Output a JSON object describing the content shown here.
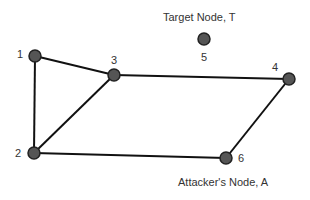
{
  "diagram": {
    "nodes": [
      {
        "id": "1",
        "label": "1",
        "x": 35,
        "y": 56
      },
      {
        "id": "2",
        "label": "2",
        "x": 34,
        "y": 153
      },
      {
        "id": "3",
        "label": "3",
        "x": 114,
        "y": 75
      },
      {
        "id": "4",
        "label": "4",
        "x": 289,
        "y": 79
      },
      {
        "id": "5",
        "label": "5",
        "x": 204,
        "y": 39
      },
      {
        "id": "6",
        "label": "6",
        "x": 226,
        "y": 158
      }
    ],
    "edges": [
      [
        "1",
        "3"
      ],
      [
        "1",
        "2"
      ],
      [
        "2",
        "3"
      ],
      [
        "3",
        "4"
      ],
      [
        "2",
        "6"
      ],
      [
        "4",
        "6"
      ]
    ],
    "annotations": {
      "target": "Target Node, T",
      "attacker": "Attacker's Node, A"
    },
    "colors": {
      "node_fill": "#555555",
      "node_stroke": "#222222",
      "edge": "#111111"
    }
  }
}
